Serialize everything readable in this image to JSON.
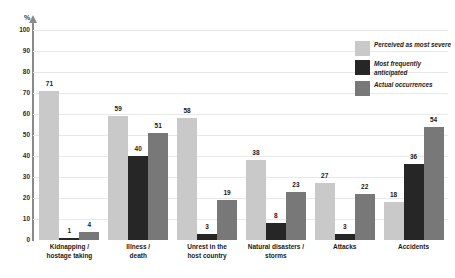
{
  "chart_data": {
    "type": "bar",
    "title": "",
    "subtitle": "",
    "xlabel": "",
    "ylabel": "%",
    "ylim": [
      0,
      100
    ],
    "ytick_step": 10,
    "grid": true,
    "legend_position": "top-right",
    "categories": [
      "Kidnapping /\nhostage taking",
      "Illness /\ndeath",
      "Unrest in the\nhost country",
      "Natural disasters /\nstorms",
      "Attacks",
      "Accidents"
    ],
    "category_lines": [
      [
        "Kidnapping /",
        "hostage taking"
      ],
      [
        "Illness /",
        "death"
      ],
      [
        "Unrest in the",
        "host country"
      ],
      [
        "Natural disasters /",
        "storms"
      ],
      [
        "Attacks",
        ""
      ],
      [
        "Accidents",
        ""
      ]
    ],
    "yticks": [
      100,
      90,
      80,
      70,
      60,
      50,
      40,
      30,
      20,
      10,
      0
    ],
    "series": [
      {
        "name": "Perceived as most severe",
        "color": "#c9c9c9",
        "values": [
          71,
          59,
          58,
          38,
          27,
          18
        ]
      },
      {
        "name": "Most frequently anticipated",
        "color": "#262626",
        "values": [
          1,
          40,
          3,
          8,
          3,
          36
        ]
      },
      {
        "name": "Actual occurrences",
        "color": "#787878",
        "values": [
          4,
          51,
          19,
          23,
          22,
          54
        ]
      }
    ]
  },
  "legend": {
    "items": [
      {
        "label": "Perceived as most severe",
        "color": "#c9c9c9"
      },
      {
        "label": "Most frequently anticipated",
        "color": "#262626"
      },
      {
        "label": "Actual occurrences",
        "color": "#787878"
      }
    ]
  },
  "axis": {
    "unit": "%"
  }
}
